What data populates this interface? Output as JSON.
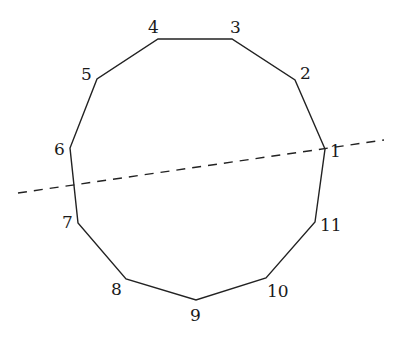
{
  "diagram": {
    "type": "polygon-with-cut-line",
    "colors": {
      "stroke": "#222222",
      "background": "#ffffff"
    },
    "vertices": [
      {
        "label": "1",
        "x": 325,
        "y": 149,
        "lx": 330,
        "ly": 157
      },
      {
        "label": "2",
        "x": 295,
        "y": 80,
        "lx": 300,
        "ly": 79
      },
      {
        "label": "3",
        "x": 232,
        "y": 39,
        "lx": 230,
        "ly": 33
      },
      {
        "label": "4",
        "x": 158,
        "y": 39,
        "lx": 148,
        "ly": 33
      },
      {
        "label": "5",
        "x": 97,
        "y": 79,
        "lx": 81,
        "ly": 80
      },
      {
        "label": "6",
        "x": 70,
        "y": 148,
        "lx": 54,
        "ly": 155
      },
      {
        "label": "7",
        "x": 78,
        "y": 223,
        "lx": 62,
        "ly": 228
      },
      {
        "label": "8",
        "x": 126,
        "y": 279,
        "lx": 111,
        "ly": 295
      },
      {
        "label": "9",
        "x": 196,
        "y": 300,
        "lx": 190,
        "ly": 321
      },
      {
        "label": "10",
        "x": 266,
        "y": 278,
        "lx": 267,
        "ly": 297
      },
      {
        "label": "11",
        "x": 315,
        "y": 222,
        "lx": 320,
        "ly": 231
      }
    ],
    "dashed_line": {
      "x1": 18,
      "y1": 193,
      "x2": 384,
      "y2": 140
    }
  }
}
